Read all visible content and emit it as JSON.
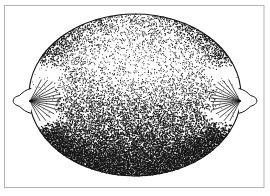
{
  "figure": {
    "type": "illustration",
    "style": "black-and-white stipple (pointillist) ink drawing",
    "background_color": "#ffffff",
    "ink_color": "#131313",
    "frame_color": "#b3b3b3"
  },
  "canvas": {
    "width": 270,
    "height": 196
  },
  "frame": {
    "x": 4.5,
    "y": 5.5,
    "width": 259.5,
    "height": 182,
    "stroke_width": 1
  },
  "lemon": {
    "cx": 135,
    "cy": 95,
    "rx": 106,
    "ry": 81,
    "outline_width": 1.1
  },
  "tips": {
    "left": {
      "path": "M 31 88.5 C 26 89.5 22.5 92.5 19.5 95.5 C 15.5 96.5 13.2 98.2 13.2 100.8 C 13.2 103.4 15.5 105.2 19.5 106.3 C 22.5 109.3 26 112.3 31 113.3",
      "ray_origin": [
        30,
        101
      ],
      "ray_dir": 1,
      "dot_center": [
        23.5,
        101
      ]
    },
    "right": {
      "path": "M 239 88.5 C 244 89.5 247.5 92.5 250.5 95.5 C 254.5 96.5 256.8 98.2 256.8 100.8 C 256.8 103.4 254.5 105.2 250.5 106.3 C 247.5 109.3 244 112.3 239 113.3",
      "ray_origin": [
        240,
        101
      ],
      "ray_dir": -1,
      "dot_center": [
        246.5,
        101
      ]
    },
    "ray_angles_deg": [
      -62,
      -50,
      -40,
      -30,
      -21,
      -13,
      -6,
      1,
      9,
      18,
      28,
      39,
      51,
      63
    ],
    "ray_lengths": [
      24,
      27,
      29,
      28,
      30,
      29,
      30,
      29,
      28,
      30,
      27,
      26,
      25,
      22
    ],
    "ray_width": 0.75,
    "outline_width": 1,
    "bump_dot_samples": 40,
    "bump_dot_accept": 0.55,
    "bump_dot_radius": 0.42,
    "bump_dot_rx": 4.8,
    "bump_dot_ry": 7.5
  },
  "stipple": {
    "seed": 1337,
    "step": 1.1,
    "dot_min": 0.42,
    "dot_max": 0.78,
    "max_density": 0.97,
    "vertical_profile": [
      [
        -1.0,
        0.3
      ],
      [
        -0.7,
        0.28
      ],
      [
        -0.45,
        0.3
      ],
      [
        -0.3,
        0.34
      ],
      [
        -0.1,
        0.42
      ],
      [
        0.1,
        0.5
      ],
      [
        0.35,
        0.62
      ],
      [
        0.6,
        0.78
      ],
      [
        0.8,
        0.9
      ],
      [
        1.0,
        0.97
      ]
    ],
    "highlight": {
      "u": 0.08,
      "v": -0.32,
      "ru": 0.5,
      "rv": 0.34,
      "strength": 0.5
    },
    "edge": {
      "start": 0.7,
      "strength": 0.55
    },
    "wedge": {
      "r_start": 0.72,
      "half_angle_deg": 26,
      "noise": 0.12,
      "residual": 0.03
    }
  }
}
